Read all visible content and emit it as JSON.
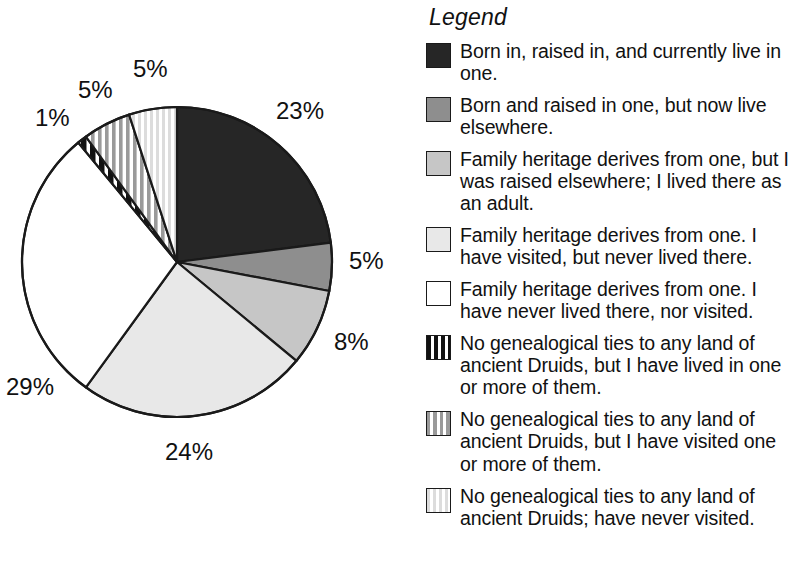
{
  "legend": {
    "title": "Legend",
    "items": [
      {
        "swatch": "solid-black-swatch",
        "color": "#262626",
        "text": "Born in, raised in, and currently live in one."
      },
      {
        "swatch": "solid-medium-gray-swatch",
        "color": "#8e8e8e",
        "text": "Born and raised in one, but now live elsewhere."
      },
      {
        "swatch": "solid-light-gray-swatch",
        "color": "#c6c6c6",
        "text": "Family heritage derives from one, but I was raised elsewhere; I lived there as an adult."
      },
      {
        "swatch": "solid-very-light-gray-swatch",
        "color": "#e8e8e8",
        "text": "Family heritage derives from one. I have visited, but never lived there."
      },
      {
        "swatch": "solid-white-swatch",
        "color": "#ffffff",
        "text": "Family heritage derives from one. I have never lived there, nor visited."
      },
      {
        "swatch": "black-vertical-stripes-swatch",
        "color": "#111111",
        "text": "No genealogical ties to any land of ancient Druids, but I have lived in one or more of them."
      },
      {
        "swatch": "gray-vertical-stripes-swatch",
        "color": "#9a9a9a",
        "text": "No genealogical ties to any land of ancient Druids, but I have visited one or more of them."
      },
      {
        "swatch": "light-vertical-stripes-swatch",
        "color": "#dcdcdc",
        "text": "No genealogical ties to any land of ancient Druids; have never visited."
      }
    ]
  },
  "chart_data": {
    "type": "pie",
    "title": "",
    "legend_position": "right",
    "start_angle_deg": 0,
    "direction": "clockwise",
    "unit": "%",
    "categories": [
      "Born in, raised in, and currently live in one.",
      "Born and raised in one, but now live elsewhere.",
      "Family heritage derives from one, but I was raised elsewhere; I lived there as an adult.",
      "Family heritage derives from one. I have visited, but never lived there.",
      "Family heritage derives from one. I have never lived there, nor visited.",
      "No genealogical ties to any land of ancient Druids, but I have lived in one or more of them.",
      "No genealogical ties to any land of ancient Druids, but I have visited one or more of them.",
      "No genealogical ties to any land of ancient Druids; have never visited."
    ],
    "values": [
      23,
      5,
      8,
      24,
      29,
      1,
      5,
      5
    ],
    "labels": [
      "23%",
      "5%",
      "8%",
      "24%",
      "29%",
      "1%",
      "5%",
      "5%"
    ],
    "fills": [
      "#262626",
      "#8e8e8e",
      "#c6c6c6",
      "#e8e8e8",
      "#ffffff",
      "black-vertical-stripes",
      "gray-vertical-stripes",
      "light-vertical-stripes"
    ]
  },
  "pie_labels": {
    "s23": "23%",
    "s5a": "5%",
    "s8": "8%",
    "s24": "24%",
    "s29": "29%",
    "s1": "1%",
    "s5b": "5%",
    "s5c": "5%"
  }
}
